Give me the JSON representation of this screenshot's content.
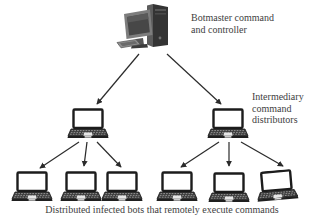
{
  "figure": {
    "botmaster_label_lines": [
      "Botmaster command",
      "and controller"
    ],
    "intermediary_label_lines": [
      "Intermediary",
      "command",
      "distributors"
    ],
    "caption": "Distributed infected bots that remotely execute commands"
  },
  "nodes": {
    "botmaster": {
      "icon": "desktop-computer-icon",
      "label": "Botmaster command and controller"
    },
    "intermediaries": [
      {
        "icon": "laptop-icon"
      },
      {
        "icon": "laptop-icon"
      }
    ],
    "bots": [
      {
        "icon": "laptop-icon"
      },
      {
        "icon": "laptop-icon"
      },
      {
        "icon": "laptop-icon"
      },
      {
        "icon": "laptop-icon"
      },
      {
        "icon": "laptop-icon"
      },
      {
        "icon": "laptop-icon"
      }
    ]
  },
  "colors": {
    "background": "#ffffff",
    "text": "#3e3e3e",
    "arrow": "#2b2b2b",
    "laptop_screen": "#ffffff",
    "laptop_body": "#3a3a3a",
    "desktop_gray": "#6e6e6e"
  }
}
